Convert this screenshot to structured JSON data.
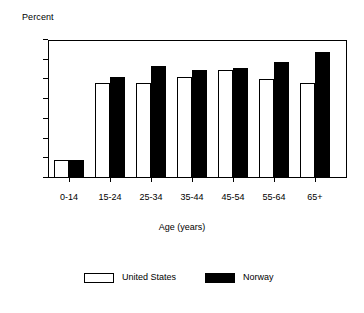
{
  "chart_data": {
    "type": "bar",
    "title": "",
    "ylabel": "Percent",
    "xlabel": "Age (years)",
    "categories": [
      "0-14",
      "15-24",
      "25-34",
      "35-44",
      "45-54",
      "55-64",
      "65+"
    ],
    "series": [
      {
        "name": "United States",
        "color": "#ffffff",
        "edge_color": "#000000",
        "values": [
          9,
          48,
          48,
          51,
          55,
          50,
          48
        ]
      },
      {
        "name": "Norway",
        "color": "#000000",
        "edge_color": "#000000",
        "values": [
          9,
          51,
          57,
          55,
          56,
          59,
          64
        ]
      }
    ],
    "ylim": [
      0,
      70
    ],
    "yticks": [
      "0",
      "10",
      "20",
      "30",
      "40",
      "50",
      "60",
      "70"
    ],
    "ytick_values": [
      0,
      10,
      20,
      30,
      40,
      50,
      60,
      70
    ],
    "grid": false,
    "legend_position": "bottom",
    "frame": true
  },
  "axes": {
    "y_title": "Percent",
    "x_title": "Age (years)"
  },
  "legend": {
    "entries": [
      {
        "label": "United States",
        "swatch": "white-bar-swatch"
      },
      {
        "label": "Norway",
        "swatch": "black-bar-swatch"
      }
    ]
  }
}
